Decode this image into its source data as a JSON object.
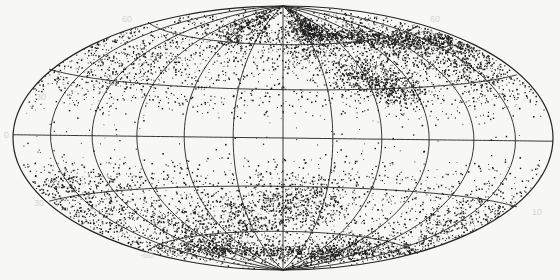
{
  "chart_data": {
    "type": "scatter",
    "title": "",
    "projection": "Hammer-Aitoff all-sky",
    "xlabel": "",
    "ylabel": "",
    "graticule": {
      "parallels_deg": [
        -60,
        -30,
        0,
        30,
        60
      ],
      "meridian_spacing_deg": 30
    },
    "tick_labels": [
      {
        "text": "30",
        "side": "left-upper"
      },
      {
        "text": "0",
        "side": "left-equator"
      },
      {
        "text": "-30",
        "side": "left-lower"
      },
      {
        "text": "-60",
        "side": "bottom-left"
      },
      {
        "text": "10",
        "side": "right-lower"
      }
    ],
    "point_count_approx": 9000,
    "point_color": "#1a1a1a",
    "background": "#f7f7f5",
    "line_color": "#222222",
    "note": "Dense point cloud; empty band along the equator (zone of avoidance), clustered concentrations in upper-center/right and lower-center."
  },
  "labels": {
    "left_30": "30",
    "left_0": "0",
    "left_m30": "30",
    "bottom_m60": "-60",
    "right_10": "10",
    "top_left": "60",
    "top_right": "60"
  }
}
